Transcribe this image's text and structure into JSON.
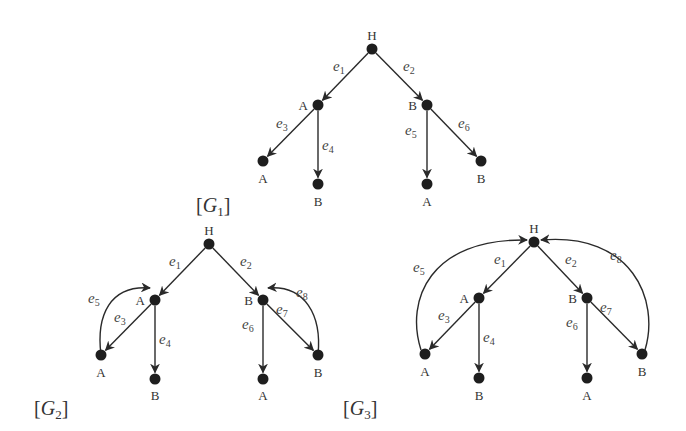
{
  "graphs": [
    {
      "id": "G1",
      "title": "[G1]",
      "title_main": "G",
      "title_sub": "1",
      "title_pos": [
        196,
        212
      ],
      "nodes": [
        {
          "id": "H",
          "label": "H",
          "x": 372,
          "y": 49,
          "lx": 372,
          "ly": 40,
          "anchor": "middle"
        },
        {
          "id": "A1",
          "label": "A",
          "x": 318,
          "y": 105,
          "lx": 308,
          "ly": 110,
          "anchor": "end"
        },
        {
          "id": "B1",
          "label": "B",
          "x": 427,
          "y": 105,
          "lx": 417,
          "ly": 110,
          "anchor": "end"
        },
        {
          "id": "A2",
          "label": "A",
          "x": 263,
          "y": 161,
          "lx": 263,
          "ly": 183,
          "anchor": "middle"
        },
        {
          "id": "B2",
          "label": "B",
          "x": 318,
          "y": 184,
          "lx": 318,
          "ly": 206,
          "anchor": "middle"
        },
        {
          "id": "A3",
          "label": "A",
          "x": 427,
          "y": 184,
          "lx": 427,
          "ly": 206,
          "anchor": "middle"
        },
        {
          "id": "B3",
          "label": "B",
          "x": 481,
          "y": 161,
          "lx": 481,
          "ly": 183,
          "anchor": "middle"
        }
      ],
      "edges": [
        {
          "label": "e",
          "sub": "1",
          "from": "H",
          "to": "A1",
          "lx": 333,
          "ly": 71
        },
        {
          "label": "e",
          "sub": "2",
          "from": "H",
          "to": "B1",
          "lx": 403,
          "ly": 71
        },
        {
          "label": "e",
          "sub": "3",
          "from": "A1",
          "to": "A2",
          "lx": 276,
          "ly": 128
        },
        {
          "label": "e",
          "sub": "4",
          "from": "A1",
          "to": "B2",
          "lx": 322,
          "ly": 150
        },
        {
          "label": "e",
          "sub": "5",
          "from": "B1",
          "to": "A3",
          "lx": 405,
          "ly": 135
        },
        {
          "label": "e",
          "sub": "6",
          "from": "B1",
          "to": "B3",
          "lx": 458,
          "ly": 128
        }
      ]
    },
    {
      "id": "G2",
      "title": "[G2]",
      "title_main": "G",
      "title_sub": "2",
      "title_pos": [
        34,
        415
      ],
      "nodes": [
        {
          "id": "H",
          "label": "H",
          "x": 209,
          "y": 244,
          "lx": 209,
          "ly": 235,
          "anchor": "middle"
        },
        {
          "id": "A1",
          "label": "A",
          "x": 155,
          "y": 300,
          "lx": 145,
          "ly": 305,
          "anchor": "end"
        },
        {
          "id": "B1",
          "label": "B",
          "x": 263,
          "y": 300,
          "lx": 253,
          "ly": 305,
          "anchor": "end"
        },
        {
          "id": "A2",
          "label": "A",
          "x": 101,
          "y": 355,
          "lx": 101,
          "ly": 377,
          "anchor": "middle"
        },
        {
          "id": "B2",
          "label": "B",
          "x": 155,
          "y": 379,
          "lx": 155,
          "ly": 400,
          "anchor": "middle"
        },
        {
          "id": "A3",
          "label": "A",
          "x": 263,
          "y": 379,
          "lx": 263,
          "ly": 400,
          "anchor": "middle"
        },
        {
          "id": "B3",
          "label": "B",
          "x": 318,
          "y": 355,
          "lx": 318,
          "ly": 377,
          "anchor": "middle"
        }
      ],
      "edges": [
        {
          "label": "e",
          "sub": "1",
          "from": "H",
          "to": "A1",
          "lx": 169,
          "ly": 266
        },
        {
          "label": "e",
          "sub": "2",
          "from": "H",
          "to": "B1",
          "lx": 240,
          "ly": 266
        },
        {
          "label": "e",
          "sub": "3",
          "from": "A1",
          "to": "A2",
          "lx": 114,
          "ly": 322
        },
        {
          "label": "e",
          "sub": "4",
          "from": "A1",
          "to": "B2",
          "lx": 159,
          "ly": 344
        },
        {
          "label": "e",
          "sub": "5",
          "from": "A2",
          "to": "A1",
          "curve": "M101,355 C96,315 110,285 150,288",
          "lx": 88,
          "ly": 303
        },
        {
          "label": "e",
          "sub": "6",
          "from": "B1",
          "to": "A3",
          "lx": 242,
          "ly": 329
        },
        {
          "label": "e",
          "sub": "7",
          "from": "B1",
          "to": "B3",
          "lx": 276,
          "ly": 314
        },
        {
          "label": "e",
          "sub": "8",
          "from": "B3",
          "to": "B1",
          "curve": "M318,355 C322,315 305,285 268,288",
          "lx": 296,
          "ly": 297
        }
      ]
    },
    {
      "id": "G3",
      "title": "[G3]",
      "title_main": "G",
      "title_sub": "3",
      "title_pos": [
        343,
        415
      ],
      "nodes": [
        {
          "id": "H",
          "label": "H",
          "x": 534,
          "y": 242,
          "lx": 534,
          "ly": 233,
          "anchor": "middle"
        },
        {
          "id": "A1",
          "label": "A",
          "x": 479,
          "y": 298,
          "lx": 469,
          "ly": 303,
          "anchor": "end"
        },
        {
          "id": "B1",
          "label": "B",
          "x": 587,
          "y": 298,
          "lx": 577,
          "ly": 303,
          "anchor": "end"
        },
        {
          "id": "A2",
          "label": "A",
          "x": 425,
          "y": 354,
          "lx": 425,
          "ly": 376,
          "anchor": "middle"
        },
        {
          "id": "B2",
          "label": "B",
          "x": 479,
          "y": 378,
          "lx": 479,
          "ly": 400,
          "anchor": "middle"
        },
        {
          "id": "A3",
          "label": "A",
          "x": 587,
          "y": 378,
          "lx": 587,
          "ly": 400,
          "anchor": "middle"
        },
        {
          "id": "B3",
          "label": "B",
          "x": 642,
          "y": 354,
          "lx": 642,
          "ly": 376,
          "anchor": "middle"
        }
      ],
      "edges": [
        {
          "label": "e",
          "sub": "1",
          "from": "H",
          "to": "A1",
          "lx": 494,
          "ly": 264
        },
        {
          "label": "e",
          "sub": "2",
          "from": "H",
          "to": "B1",
          "lx": 565,
          "ly": 264
        },
        {
          "label": "e",
          "sub": "3",
          "from": "A1",
          "to": "A2",
          "lx": 438,
          "ly": 320
        },
        {
          "label": "e",
          "sub": "4",
          "from": "A1",
          "to": "B2",
          "lx": 483,
          "ly": 342
        },
        {
          "label": "e",
          "sub": "5",
          "from": "A2",
          "to": "H",
          "curve": "M421,350 C405,300 430,238 527,240",
          "lx": 413,
          "ly": 272
        },
        {
          "label": "e",
          "sub": "6",
          "from": "B1",
          "to": "A3",
          "lx": 566,
          "ly": 327
        },
        {
          "label": "e",
          "sub": "7",
          "from": "B1",
          "to": "B3",
          "lx": 600,
          "ly": 312
        },
        {
          "label": "e",
          "sub": "8",
          "from": "B3",
          "to": "H",
          "curve": "M645,350 C660,300 632,232 541,240",
          "lx": 610,
          "ly": 260
        }
      ]
    }
  ]
}
